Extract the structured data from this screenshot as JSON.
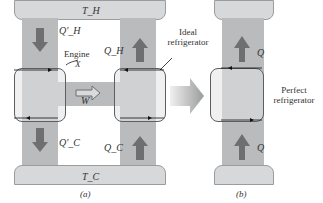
{
  "panel_a": {
    "hot_reservoir": "T_H",
    "cold_reservoir": "T_C",
    "engine_label": "Engine",
    "engine_name": "X",
    "q_h_prime": "Q'_H",
    "q_c_prime": "Q'_C",
    "q_h": "Q_H",
    "q_c": "Q_C",
    "work": "W",
    "refrigerator_label": "Ideal refrigerator",
    "caption": "(a)"
  },
  "panel_b": {
    "q_top": "Q",
    "q_bottom": "Q",
    "refrigerator_label": "Perfect refrigerator",
    "caption": "(b)"
  },
  "colors": {
    "reservoir": "#d6d8da",
    "column": "#b9bbbd",
    "arrow": "#6e6f70",
    "box": "#e3e4e5"
  }
}
